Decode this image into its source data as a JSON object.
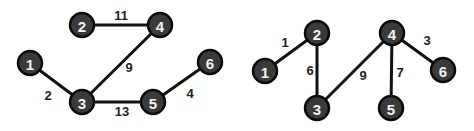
{
  "graphs": [
    {
      "name": "left-graph",
      "nodes": [
        {
          "id": "1",
          "x": 30,
          "y": 63
        },
        {
          "id": "2",
          "x": 82,
          "y": 25
        },
        {
          "id": "3",
          "x": 82,
          "y": 102
        },
        {
          "id": "4",
          "x": 160,
          "y": 25
        },
        {
          "id": "5",
          "x": 153,
          "y": 102
        },
        {
          "id": "6",
          "x": 210,
          "y": 62
        }
      ],
      "edges": [
        {
          "from": "2",
          "to": "4",
          "weight": "11",
          "lx": 121,
          "ly": 15
        },
        {
          "from": "4",
          "to": "3",
          "weight": "9",
          "lx": 129,
          "ly": 67
        },
        {
          "from": "1",
          "to": "3",
          "weight": "2",
          "lx": 48,
          "ly": 95
        },
        {
          "from": "3",
          "to": "5",
          "weight": "13",
          "lx": 122,
          "ly": 111
        },
        {
          "from": "5",
          "to": "6",
          "weight": "4",
          "lx": 190,
          "ly": 93
        }
      ]
    },
    {
      "name": "right-graph",
      "nodes": [
        {
          "id": "1",
          "x": 265,
          "y": 71
        },
        {
          "id": "2",
          "x": 317,
          "y": 33
        },
        {
          "id": "3",
          "x": 317,
          "y": 108
        },
        {
          "id": "4",
          "x": 392,
          "y": 33
        },
        {
          "id": "5",
          "x": 391,
          "y": 108
        },
        {
          "id": "6",
          "x": 443,
          "y": 70
        }
      ],
      "edges": [
        {
          "from": "1",
          "to": "2",
          "weight": "1",
          "lx": 285,
          "ly": 42
        },
        {
          "from": "2",
          "to": "3",
          "weight": "6",
          "lx": 310,
          "ly": 70
        },
        {
          "from": "3",
          "to": "4",
          "weight": "9",
          "lx": 363,
          "ly": 75
        },
        {
          "from": "4",
          "to": "5",
          "weight": "7",
          "lx": 400,
          "ly": 72
        },
        {
          "from": "4",
          "to": "6",
          "weight": "3",
          "lx": 427,
          "ly": 40
        }
      ]
    }
  ],
  "colors": {
    "node_fill": "#3a3a3a",
    "node_stroke": "#0a0a0a",
    "node_text": "#f2f2f2",
    "edge": "#111111",
    "weight_text": "#222222",
    "background": "#ffffff"
  }
}
